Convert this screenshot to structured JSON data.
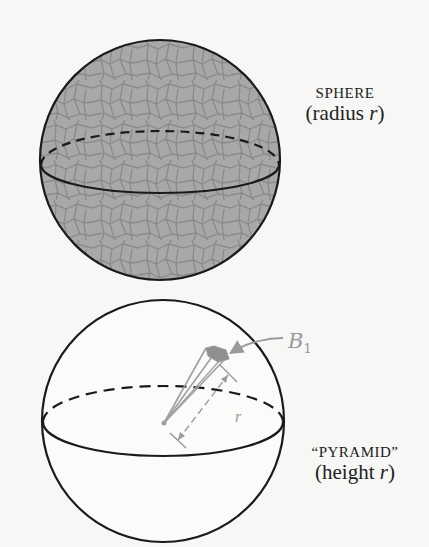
{
  "figure": {
    "top": {
      "label_title": "SPHERE",
      "label_sub_prefix": "(radius ",
      "label_var": "r",
      "label_sub_suffix": ")",
      "fill_color": "#a9a9a9",
      "texture": "cracked-cell pattern"
    },
    "bottom": {
      "label_title": "“PYRAMID”",
      "label_sub_prefix": "(height ",
      "label_var": "r",
      "label_sub_suffix": ")",
      "base_label": "B",
      "base_subscript": "1",
      "height_label": "r",
      "annotation_color": "#9a9a9a"
    },
    "line_color": "#1a1a1a"
  }
}
